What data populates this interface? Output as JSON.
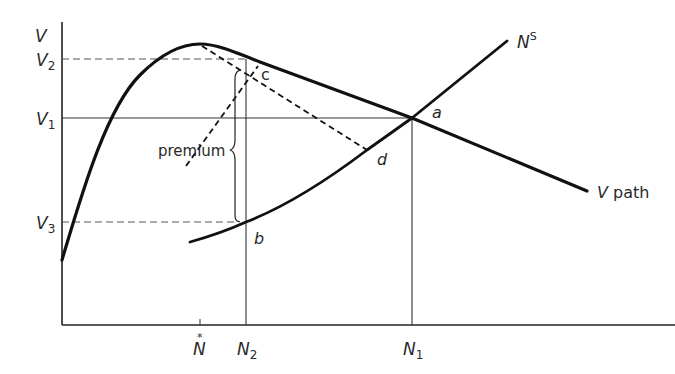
{
  "diagram": {
    "y_axis_label": "V",
    "levels": {
      "V2": {
        "main": "V",
        "sub": "2"
      },
      "V1": {
        "main": "V",
        "sub": "1"
      },
      "V3": {
        "main": "V",
        "sub": "3"
      }
    },
    "x_ticks": {
      "Nstar": {
        "main": "N",
        "mark": "*"
      },
      "N2": {
        "main": "N",
        "sub": "2"
      },
      "N1": {
        "main": "N",
        "sub": "1"
      }
    },
    "curves": {
      "v_path": {
        "main": "V",
        "rest": " path"
      },
      "supply": {
        "main": "N",
        "sup": "S"
      }
    },
    "points": {
      "a": "a",
      "b": "b",
      "c": "c",
      "d": "d"
    },
    "annotation": "premium",
    "colors": {
      "ink": "#1a1a1a",
      "dash": "#555555",
      "thin": "#333333"
    }
  }
}
